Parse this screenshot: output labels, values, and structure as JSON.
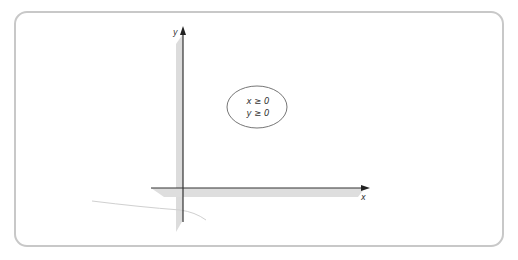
{
  "diagram": {
    "axes": {
      "x_label": "x",
      "y_label": "y"
    },
    "region_label": {
      "line1": "x ≥ 0",
      "line2": "y ≥ 0"
    },
    "colors": {
      "frame_border": "#c8c8c8",
      "axis": "#333333",
      "shadow": "#d9d9d9",
      "ellipse": "#555555"
    }
  }
}
